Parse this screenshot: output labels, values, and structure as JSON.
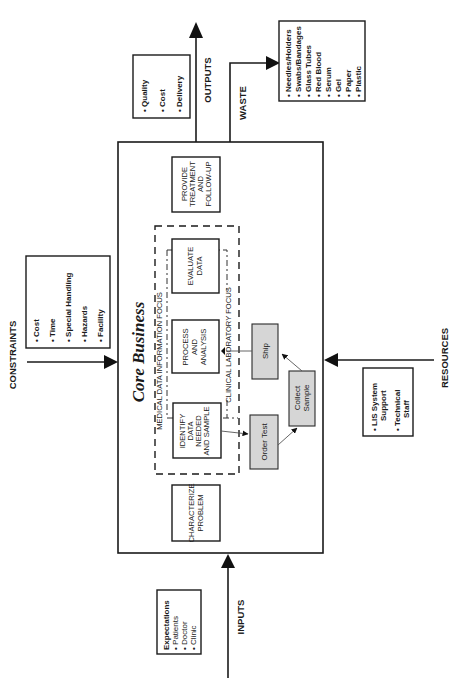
{
  "diagram": {
    "title": "Core Business",
    "flows": {
      "inputs": "INPUTS",
      "outputs": "OUTPUTS",
      "constraints": "CONSTRAINTS",
      "resources": "RESOURCES",
      "waste": "WASTE"
    },
    "inputs_box": {
      "heading": "Expectations",
      "items": [
        "Patients",
        "Doctor",
        "Clinic"
      ],
      "extra_bullets": 4
    },
    "outputs_box": {
      "items": [
        "Quality",
        "Cost",
        "Delivery"
      ]
    },
    "constraints_box": {
      "items": [
        "Cost",
        "Time",
        "Special Handling",
        "Hazards",
        "Facility"
      ]
    },
    "resources_box": {
      "items": [
        {
          "line1": "LIS System",
          "line2": "Support"
        },
        {
          "line1": "Technical",
          "line2": "Staff"
        }
      ]
    },
    "waste_box": {
      "items": [
        "Needles/Holders",
        "Swabs/Bandages",
        "Glass Tubes",
        "Red Blood",
        "Serum",
        "Gel",
        "Paper",
        "Plastic"
      ]
    },
    "focus_areas": {
      "medical": "MEDICAL DATA INFORMATION FOCUS",
      "clinical": "CLINICAL LABORATORY FOCUS"
    },
    "process_steps": [
      {
        "id": "characterize",
        "lines": [
          "CHARACTERIZE",
          "PROBLEM"
        ]
      },
      {
        "id": "identify",
        "lines": [
          "IDENTIFY",
          "DATA",
          "NEEDED",
          "AND SAMPLE"
        ]
      },
      {
        "id": "process",
        "lines": [
          "PROCESS",
          "AND",
          "ANALYSIS"
        ]
      },
      {
        "id": "evaluate",
        "lines": [
          "EVALUATE",
          "DATA"
        ]
      },
      {
        "id": "treatment",
        "lines": [
          "PROVIDE",
          "TREATMENT",
          "AND",
          "FOLLOW-UP"
        ]
      }
    ],
    "lab_steps": {
      "order_test": "Order Test",
      "collect_sample": [
        "Collect",
        "Sample"
      ],
      "ship": "Ship"
    },
    "bullet": "•"
  }
}
